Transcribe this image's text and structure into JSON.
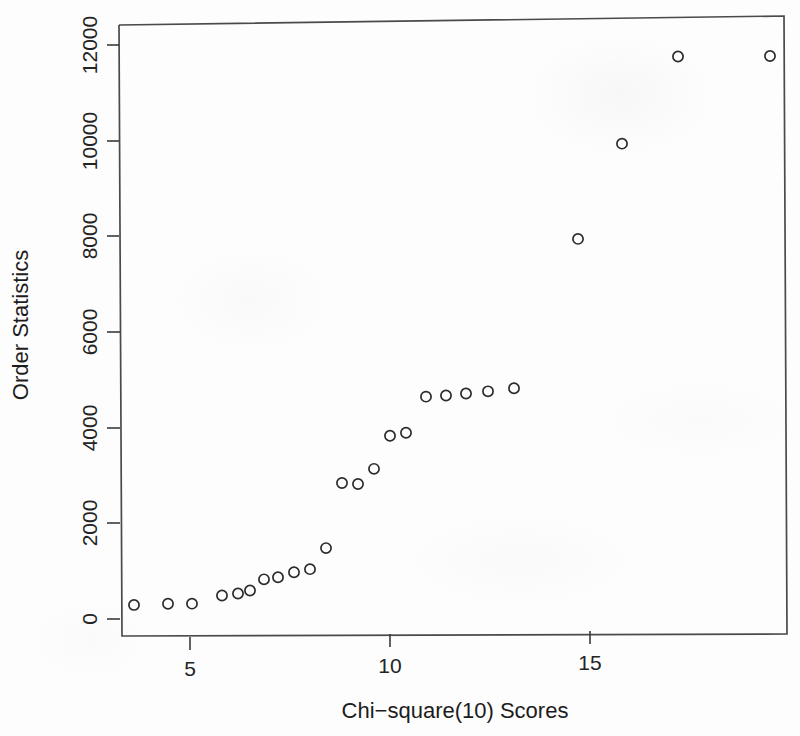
{
  "chart_data": {
    "type": "scatter",
    "title": "",
    "xlabel": "Chi−square(10) Scores",
    "ylabel": "Order Statistics",
    "xlim": [
      3.1,
      19.9
    ],
    "ylim": [
      -200,
      12450
    ],
    "grid": false,
    "legend": null,
    "marker": "open-circle",
    "xticks": [
      5,
      10,
      15
    ],
    "xtick_labels": [
      "5",
      "10",
      "15"
    ],
    "yticks": [
      0,
      2000,
      4000,
      6000,
      8000,
      10000,
      12000
    ],
    "ytick_labels": [
      "0",
      "2000",
      "4000",
      "6000",
      "8000",
      "10000",
      "12000"
    ],
    "x": [
      3.6,
      4.45,
      5.05,
      5.8,
      6.2,
      6.5,
      6.85,
      7.2,
      7.6,
      8.0,
      8.4,
      8.8,
      9.2,
      9.6,
      10.0,
      10.4,
      10.9,
      11.4,
      11.9,
      12.45,
      13.1,
      14.7,
      15.8,
      17.2,
      19.5
    ],
    "y": [
      293,
      314,
      314,
      481,
      523,
      585,
      815,
      857,
      961,
      1024,
      1463,
      2822,
      2801,
      3115,
      3805,
      3867,
      4620,
      4641,
      4683,
      4725,
      4788,
      7903,
      9890,
      11708,
      11708
    ],
    "n_points": 25
  },
  "colors": {
    "background": "#fdfdfd",
    "axis": "#3a3a3a",
    "frame": "#4a4a4a",
    "marker_stroke": "#2b2b2b",
    "text": "#1c1c1c"
  },
  "axis": {
    "x_title": "Chi−square(10) Scores",
    "y_title": "Order Statistics"
  }
}
